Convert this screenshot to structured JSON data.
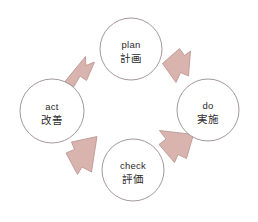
{
  "diagram": {
    "type": "cycle-diagram",
    "direction": "clockwise",
    "background_color": "#ffffff",
    "circle_stroke_color": "#9a8b91",
    "arrow_fill_color": "#d9b4ae",
    "arrow_stroke_color": "#b8928c",
    "text_color": "#2b2b2b",
    "nodes": [
      {
        "id": "plan",
        "position": "top",
        "label_en": "plan",
        "label_ja": "計画",
        "cx": 131,
        "cy": 49,
        "r": 31
      },
      {
        "id": "do",
        "position": "right",
        "label_en": "do",
        "label_ja": "実施",
        "cx": 208,
        "cy": 110,
        "r": 31
      },
      {
        "id": "check",
        "position": "bottom",
        "label_en": "check",
        "label_ja": "評価",
        "cx": 133,
        "cy": 170,
        "r": 31
      },
      {
        "id": "act",
        "position": "left",
        "label_en": "act",
        "label_ja": "改善",
        "cx": 52,
        "cy": 111,
        "r": 32
      }
    ],
    "arrows": [
      {
        "id": "plan-to-do",
        "from": "plan",
        "to": "do",
        "direction": "down-right"
      },
      {
        "id": "do-to-check",
        "from": "do",
        "to": "check",
        "direction": "down-left"
      },
      {
        "id": "check-to-act",
        "from": "check",
        "to": "act",
        "direction": "up-left"
      },
      {
        "id": "act-to-plan",
        "from": "act",
        "to": "plan",
        "direction": "up-right"
      }
    ]
  }
}
